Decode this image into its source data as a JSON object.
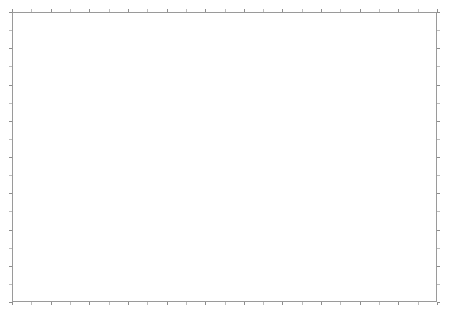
{
  "figure": {
    "title": "",
    "background_color": "#ffffff",
    "width": 450,
    "height": 315
  },
  "frame": {
    "border_color": "#9a9a9a",
    "left": 12,
    "top": 12,
    "width": 425,
    "height": 290,
    "tick_color": "#8d8d8d",
    "tick_length": 3,
    "x_tick_count": 22,
    "y_tick_count": 16,
    "axis_labels_visible": false,
    "tick_labels_visible": false
  },
  "chart_data": {
    "type": "heatmap",
    "title": "",
    "subtitle": "",
    "xlabel": "",
    "ylabel": "",
    "legend_position": "none",
    "grid": true,
    "colormap": "greyscale",
    "color_low": "#f2f2f2",
    "color_high": "#000000",
    "nodata_color": "#ffffff",
    "xlim": [
      0,
      425
    ],
    "ylim": [
      0,
      290
    ],
    "x_tick_labels": [],
    "y_tick_labels": [],
    "annotations": [],
    "grid_resolution": {
      "cols": 170,
      "rows": 116,
      "cell_px": 2.5
    },
    "boundary_polygon": [
      [
        88,
        8
      ],
      [
        300,
        8
      ],
      [
        420,
        8
      ],
      [
        420,
        120
      ],
      [
        420,
        193
      ],
      [
        345,
        193
      ],
      [
        300,
        200
      ],
      [
        282,
        240
      ],
      [
        262,
        272
      ],
      [
        238,
        283
      ],
      [
        218,
        283
      ],
      [
        200,
        262
      ],
      [
        186,
        228
      ],
      [
        172,
        196
      ],
      [
        150,
        178
      ],
      [
        126,
        172
      ],
      [
        112,
        170
      ],
      [
        96,
        170
      ],
      [
        62,
        170
      ],
      [
        40,
        170
      ],
      [
        28,
        158
      ],
      [
        28,
        140
      ],
      [
        40,
        128
      ],
      [
        74,
        128
      ],
      [
        110,
        128
      ],
      [
        146,
        128
      ],
      [
        146,
        96
      ],
      [
        118,
        84
      ],
      [
        96,
        62
      ],
      [
        88,
        34
      ]
    ],
    "hotspots": [
      {
        "name": "central-core",
        "cx": 200,
        "cy": 145,
        "rx": 34,
        "ry": 26,
        "intensity": 1.0
      },
      {
        "name": "north-basin",
        "cx": 196,
        "cy": 100,
        "rx": 40,
        "ry": 22,
        "intensity": 0.88
      },
      {
        "name": "northeast-ridge",
        "cx": 248,
        "cy": 92,
        "rx": 24,
        "ry": 16,
        "intensity": 0.72
      },
      {
        "name": "east-corridor-1",
        "cx": 268,
        "cy": 132,
        "rx": 30,
        "ry": 11,
        "intensity": 0.8
      },
      {
        "name": "east-corridor-2",
        "cx": 312,
        "cy": 128,
        "rx": 26,
        "ry": 10,
        "intensity": 0.7
      },
      {
        "name": "east-corridor-3",
        "cx": 352,
        "cy": 134,
        "rx": 22,
        "ry": 9,
        "intensity": 0.55
      },
      {
        "name": "far-east-spur",
        "cx": 400,
        "cy": 150,
        "rx": 16,
        "ry": 12,
        "intensity": 0.58
      },
      {
        "name": "northwest-patch",
        "cx": 152,
        "cy": 92,
        "rx": 16,
        "ry": 11,
        "intensity": 0.52
      },
      {
        "name": "south-central",
        "cx": 212,
        "cy": 190,
        "rx": 24,
        "ry": 20,
        "intensity": 0.74
      },
      {
        "name": "south-harbor",
        "cx": 232,
        "cy": 232,
        "rx": 18,
        "ry": 14,
        "intensity": 0.62
      },
      {
        "name": "south-tip",
        "cx": 222,
        "cy": 268,
        "rx": 12,
        "ry": 11,
        "intensity": 0.66
      },
      {
        "name": "southeast-lobe",
        "cx": 268,
        "cy": 208,
        "rx": 20,
        "ry": 13,
        "intensity": 0.6
      },
      {
        "name": "southwest-coast",
        "cx": 176,
        "cy": 208,
        "rx": 14,
        "ry": 18,
        "intensity": 0.5
      },
      {
        "name": "mid-valley",
        "cx": 236,
        "cy": 160,
        "rx": 20,
        "ry": 12,
        "intensity": 0.64
      },
      {
        "name": "upper-north",
        "cx": 170,
        "cy": 62,
        "rx": 18,
        "ry": 12,
        "intensity": 0.42
      },
      {
        "name": "north-spur",
        "cx": 222,
        "cy": 58,
        "rx": 14,
        "ry": 9,
        "intensity": 0.38
      }
    ]
  }
}
